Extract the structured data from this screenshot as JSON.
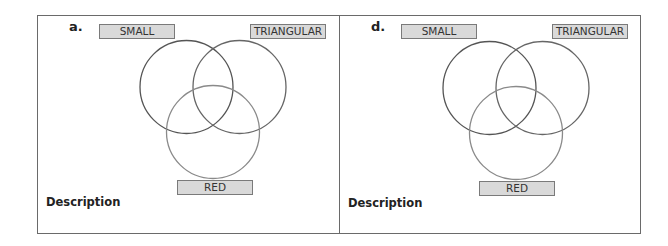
{
  "panels": [
    {
      "letter": "a.",
      "labels": {
        "small": "SMALL",
        "triangular": "TRIANGULAR",
        "red": "RED"
      },
      "description_label": "Description"
    },
    {
      "letter": "d.",
      "labels": {
        "small": "SMALL",
        "triangular": "TRIANGULAR",
        "red": "RED"
      },
      "description_label": "Description"
    }
  ],
  "colors": {
    "border": "#6a6a6a",
    "label_fill": "#d9d9d9",
    "circle_small": "#555555",
    "circle_triangular": "#666666",
    "circle_red": "#8a8a8a"
  }
}
